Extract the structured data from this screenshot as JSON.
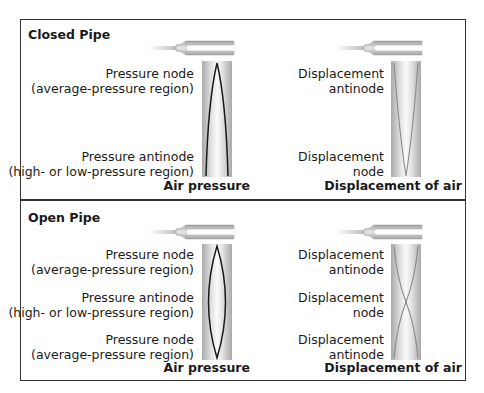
{
  "colors": {
    "border": "#333333",
    "pipe_edge": "#b5b5b5",
    "pipe_center": "#f2f2f2",
    "pressure_curve": "#1a1a1a",
    "displacement_curve": "#8a8a8a"
  },
  "closed_pipe": {
    "title": "Closed Pipe",
    "pressure": {
      "top_label_1": "Pressure node",
      "top_label_2": "(average-pressure region)",
      "bottom_label_1": "Pressure antinode",
      "bottom_label_2": "(high- or low-pressure region)",
      "caption": "Air pressure"
    },
    "displacement": {
      "top_label_1": "Displacement",
      "top_label_2": "antinode",
      "bottom_label_1": "Displacement",
      "bottom_label_2": "node",
      "caption": "Displacement of air"
    }
  },
  "open_pipe": {
    "title": "Open Pipe",
    "pressure": {
      "top_label_1": "Pressure node",
      "top_label_2": "(average-pressure region)",
      "mid_label_1": "Pressure antinode",
      "mid_label_2": "(high- or low-pressure region)",
      "bottom_label_1": "Pressure node",
      "bottom_label_2": "(average-pressure region)",
      "caption": "Air pressure"
    },
    "displacement": {
      "top_label_1": "Displacement",
      "top_label_2": "antinode",
      "mid_label_1": "Displacement",
      "mid_label_2": "node",
      "bottom_label_1": "Displacement",
      "bottom_label_2": "antinode",
      "caption": "Displacement of air"
    }
  }
}
